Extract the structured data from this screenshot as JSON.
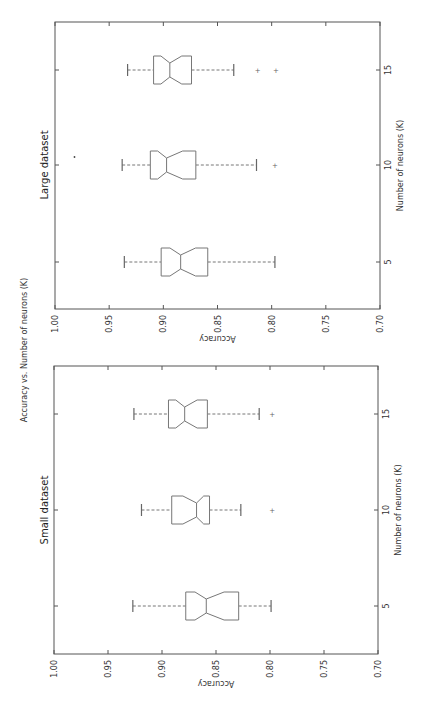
{
  "figure": {
    "title": "Accuracy vs. Number of neurons (K)",
    "rotation": "90deg counter-clockwise (landscape figure shown in portrait)"
  },
  "chart_data": [
    {
      "type": "boxplot",
      "title": "Large dataset",
      "xlabel": "Number of neurons (K)",
      "ylabel": "Accuracy",
      "ylim": [
        0.7,
        1.0
      ],
      "yticks": [
        "1.00",
        "0.95",
        "0.90",
        "0.85",
        "0.80",
        "0.75",
        "0.70"
      ],
      "categories": [
        "5",
        "10",
        "15"
      ],
      "notched": true,
      "boxes": [
        {
          "k": "5",
          "whisker_high": 0.936,
          "q3": 0.902,
          "median": 0.884,
          "q1": 0.859,
          "whisker_low": 0.797,
          "outliers": []
        },
        {
          "k": "10",
          "whisker_high": 0.938,
          "q3": 0.912,
          "median": 0.897,
          "q1": 0.87,
          "whisker_low": 0.814,
          "outliers": [
            0.982,
            0.797
          ]
        },
        {
          "k": "15",
          "whisker_high": 0.933,
          "q3": 0.909,
          "median": 0.894,
          "q1": 0.874,
          "whisker_low": 0.835,
          "outliers": [
            0.813,
            0.796
          ]
        }
      ]
    },
    {
      "type": "boxplot",
      "title": "Small dataset",
      "xlabel": "Number of neurons (K)",
      "ylabel": "Accuracy",
      "ylim": [
        0.7,
        1.0
      ],
      "yticks": [
        "1.00",
        "0.95",
        "0.90",
        "0.85",
        "0.80",
        "0.75",
        "0.70"
      ],
      "categories": [
        "5",
        "10",
        "15"
      ],
      "notched": true,
      "boxes": [
        {
          "k": "5",
          "whisker_high": 0.927,
          "q3": 0.878,
          "median": 0.859,
          "q1": 0.829,
          "whisker_low": 0.799,
          "outliers": []
        },
        {
          "k": "10",
          "whisker_high": 0.919,
          "q3": 0.891,
          "median": 0.868,
          "q1": 0.856,
          "whisker_low": 0.827,
          "outliers": [
            0.798
          ]
        },
        {
          "k": "15",
          "whisker_high": 0.926,
          "q3": 0.894,
          "median": 0.879,
          "q1": 0.858,
          "whisker_low": 0.81,
          "outliers": [
            0.798
          ]
        }
      ]
    }
  ],
  "layout": {
    "panels": [
      {
        "left": 55,
        "top": 22,
        "right": 380,
        "bottom": 309,
        "k_pos": {
          "5": 262,
          "10": 165,
          "15": 70
        },
        "subtitle_x": 48
      },
      {
        "left": 54,
        "top": 366,
        "right": 378,
        "bottom": 654,
        "k_pos": {
          "5": 606,
          "10": 510,
          "15": 414
        },
        "subtitle_x": 48
      }
    ]
  }
}
